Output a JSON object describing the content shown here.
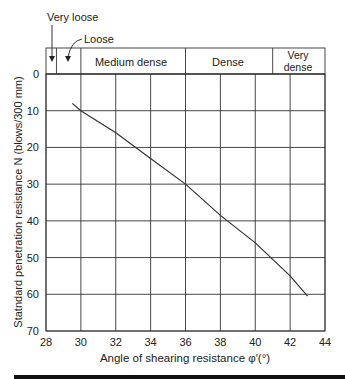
{
  "chart_data": {
    "type": "line",
    "title": "",
    "xlabel": "Angle of shearing resistance φ′(°)",
    "ylabel": "Statndard penetration resistance N (blows/300 mm)",
    "xlim": [
      28,
      44
    ],
    "ylim": [
      0,
      70
    ],
    "y_inverted": true,
    "grid": true,
    "x_ticks": [
      "28",
      "30",
      "32",
      "34",
      "36",
      "38",
      "40",
      "42",
      "44"
    ],
    "y_ticks": [
      "0",
      "10",
      "20",
      "30",
      "40",
      "50",
      "60",
      "70"
    ],
    "series": [
      {
        "name": "N vs φ′",
        "x": [
          29.5,
          30,
          32,
          34,
          36,
          38,
          40,
          42,
          43
        ],
        "y": [
          8,
          10,
          16,
          23,
          30,
          38.5,
          46,
          55,
          60.5
        ]
      }
    ],
    "density_bands": [
      {
        "label": "Very loose",
        "from": 28,
        "to": 28.6
      },
      {
        "label": "Loose",
        "from": 28.6,
        "to": 30
      },
      {
        "label": "Medium dense",
        "from": 30,
        "to": 36
      },
      {
        "label": "Dense",
        "from": 36,
        "to": 41
      },
      {
        "label": "Very dense",
        "from": 41,
        "to": 44
      }
    ],
    "annotations": [
      "Very loose",
      "Loose"
    ]
  },
  "labels": {
    "very_loose": "Very loose",
    "loose": "Loose",
    "medium_dense": "Medium dense",
    "dense": "Dense",
    "very_dense_1": "Very",
    "very_dense_2": "dense",
    "xlabel": "Angle of shearing resistance φ′(°)",
    "ylabel": "Statndard penetration resistance N (blows/300 mm)"
  },
  "colors": {
    "line": "#333333",
    "grid": "#333333",
    "rule": "#111111"
  }
}
